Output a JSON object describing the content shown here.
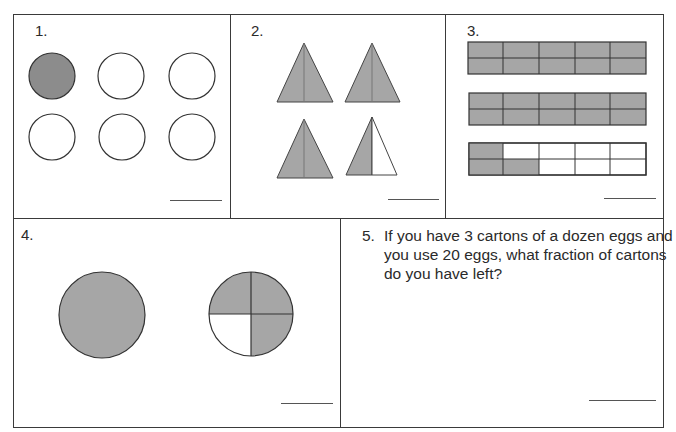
{
  "worksheet": {
    "colors": {
      "shade": "#a6a6a6",
      "dark_shade": "#8c8c8c",
      "line": "#333333",
      "answer_line": "#555555"
    },
    "problems": [
      {
        "number": "1.",
        "type": "circles",
        "total": 6,
        "shaded": 1
      },
      {
        "number": "2.",
        "type": "triangles-halved",
        "triangles": 4,
        "total_halves": 8,
        "shaded_halves": 7
      },
      {
        "number": "3.",
        "type": "grid-bars",
        "bars": 3,
        "cells_per_bar": 10,
        "shaded_per_bar": [
          10,
          10,
          3
        ]
      },
      {
        "number": "4.",
        "type": "circles-quartered",
        "whole_circles": 1,
        "quarter_circle_shaded": 3
      },
      {
        "number": "5.",
        "type": "word-problem",
        "text": "If you have 3 cartons of a dozen eggs and you use 20 eggs, what fraction of cartons do you have left?"
      }
    ]
  }
}
